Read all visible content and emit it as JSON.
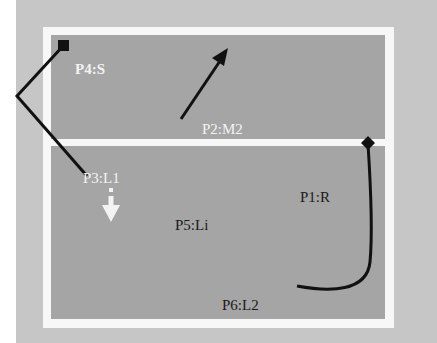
{
  "diagram": {
    "colors": {
      "background": "#c6c6c6",
      "frame": "#f7f7f7",
      "panel": "#a5a5a5",
      "stroke": "#111111",
      "light_text": "#f3f3f3",
      "dark_text": "#1a1a1a"
    },
    "regions": [
      {
        "id": "top",
        "name": "upper-zone"
      },
      {
        "id": "bottom",
        "name": "lower-zone"
      }
    ],
    "labels": {
      "p4": "P4:S",
      "p2": "P2:M2",
      "p3": "P3:L1",
      "p1": "P1:R",
      "p5": "P5:Li",
      "p6": "P6:L2"
    },
    "paths": [
      {
        "id": "path-p4",
        "description": "square marker with bent line from upper-left corner into lower zone"
      },
      {
        "id": "path-p2",
        "description": "straight arrow pointing up-right in upper zone"
      },
      {
        "id": "path-p1",
        "description": "diamond marker on divider with curve descending to bottom and curling left"
      },
      {
        "id": "path-p3",
        "description": "small white downward arrow below P3 label"
      }
    ]
  }
}
